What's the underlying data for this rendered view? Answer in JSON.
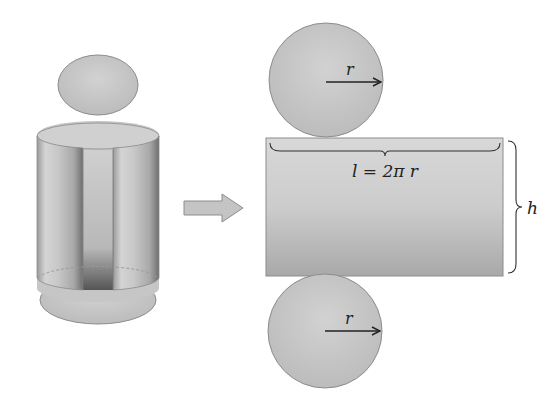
{
  "figure": {
    "labels": {
      "radius_top": "r",
      "radius_bottom": "r",
      "length": "l = 2π r",
      "height": "h"
    },
    "colors": {
      "fill_light": "#d6d6d6",
      "fill_mid": "#bdbdbd",
      "fill_dark": "#8a8a8a",
      "stroke": "#8c8c8c",
      "text": "#222222",
      "arrow_fill": "#c4c4c4"
    }
  }
}
